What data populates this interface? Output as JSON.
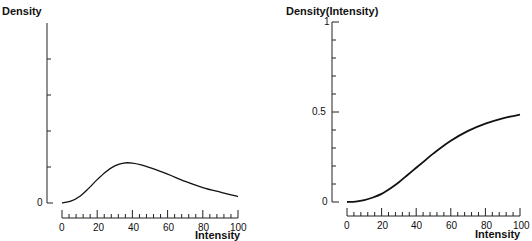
{
  "chart_data": [
    {
      "type": "line",
      "title": "Density",
      "xlabel": "Intensity",
      "ylabel": "Density",
      "xlim": [
        0,
        100
      ],
      "ylim": [
        0,
        5
      ],
      "x_ticks": [
        0,
        20,
        40,
        60,
        80,
        100
      ],
      "y_tick_labels": [
        "0"
      ],
      "grid": false,
      "legend": null,
      "x": [
        0,
        5,
        10,
        15,
        20,
        25,
        30,
        35,
        40,
        45,
        50,
        60,
        70,
        80,
        90,
        100
      ],
      "series": [
        {
          "name": "Density",
          "values": [
            0.0,
            0.05,
            0.18,
            0.4,
            0.65,
            0.87,
            1.03,
            1.11,
            1.11,
            1.06,
            0.98,
            0.8,
            0.6,
            0.43,
            0.3,
            0.18
          ]
        }
      ]
    },
    {
      "type": "line",
      "title": "Density(Intensity)",
      "xlabel": "Intensity",
      "ylabel": "Density(Intensity)",
      "xlim": [
        0,
        100
      ],
      "ylim": [
        0,
        1
      ],
      "x_ticks": [
        0,
        20,
        40,
        60,
        80,
        100
      ],
      "y_tick_labels": [
        "0",
        "0.5",
        "1"
      ],
      "grid": false,
      "legend": null,
      "x": [
        0,
        5,
        10,
        15,
        20,
        25,
        30,
        35,
        40,
        45,
        50,
        60,
        70,
        80,
        90,
        100
      ],
      "series": [
        {
          "name": "Density(Intensity)",
          "values": [
            0.0,
            0.002,
            0.01,
            0.025,
            0.045,
            0.075,
            0.11,
            0.15,
            0.19,
            0.23,
            0.27,
            0.34,
            0.395,
            0.435,
            0.465,
            0.485
          ]
        }
      ]
    }
  ],
  "left": {
    "title": "Density",
    "xlabel": "Intensity",
    "y0": "0",
    "xt": [
      "0",
      "20",
      "40",
      "60",
      "80",
      "100"
    ]
  },
  "right": {
    "title": "Density(Intensity)",
    "xlabel": "Intensity",
    "y0": "0",
    "y05": "0.5",
    "y1": "1",
    "xt": [
      "0",
      "20",
      "40",
      "60",
      "80",
      "100"
    ]
  }
}
